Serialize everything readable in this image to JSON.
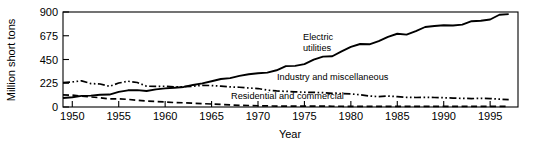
{
  "chart_data": {
    "type": "line",
    "title": "",
    "xlabel": "Year",
    "ylabel": "Million short tons",
    "xlim": [
      1949,
      1998
    ],
    "ylim": [
      0,
      900
    ],
    "yticks": [
      0,
      225,
      450,
      675,
      900
    ],
    "xticks": [
      1950,
      1955,
      1960,
      1965,
      1970,
      1975,
      1980,
      1985,
      1990,
      1995
    ],
    "ytick_labels": [
      "0",
      "225",
      "450",
      "675",
      "900"
    ],
    "xtick_labels": [
      "1950",
      "1955",
      "1960",
      "1965",
      "1970",
      "1975",
      "1980",
      "1985",
      "1990",
      "1995"
    ],
    "grid": false,
    "legend_position": "inline-annotations",
    "x": [
      1949,
      1950,
      1951,
      1952,
      1953,
      1954,
      1955,
      1956,
      1957,
      1958,
      1959,
      1960,
      1961,
      1962,
      1963,
      1964,
      1965,
      1966,
      1967,
      1968,
      1969,
      1970,
      1971,
      1972,
      1973,
      1974,
      1975,
      1976,
      1977,
      1978,
      1979,
      1980,
      1981,
      1982,
      1983,
      1984,
      1985,
      1986,
      1987,
      1988,
      1989,
      1990,
      1991,
      1992,
      1993,
      1994,
      1995,
      1996,
      1997
    ],
    "series": [
      {
        "name": "Electric utilities",
        "label": "Electric utilities",
        "label_line1": "Electric",
        "label_line2": "utilities",
        "style": "solid",
        "color": "#000000",
        "values": [
          85,
          92,
          105,
          108,
          116,
          118,
          143,
          158,
          160,
          152,
          167,
          176,
          182,
          190,
          209,
          224,
          244,
          265,
          274,
          295,
          310,
          320,
          326,
          348,
          387,
          390,
          406,
          449,
          477,
          481,
          527,
          569,
          597,
          594,
          625,
          665,
          694,
          686,
          718,
          758,
          767,
          774,
          772,
          780,
          813,
          817,
          829,
          874,
          880
        ]
      },
      {
        "name": "Industry and miscellaneous",
        "label": "Industry and miscellaneous",
        "style": "dash-dot-dot",
        "color": "#000000",
        "values": [
          232,
          237,
          248,
          222,
          218,
          196,
          227,
          244,
          232,
          197,
          195,
          197,
          190,
          192,
          197,
          205,
          203,
          198,
          190,
          187,
          180,
          175,
          160,
          152,
          148,
          144,
          140,
          138,
          136,
          130,
          127,
          124,
          116,
          104,
          98,
          104,
          98,
          92,
          90,
          92,
          90,
          88,
          84,
          82,
          80,
          82,
          80,
          74,
          70
        ]
      },
      {
        "name": "Residential and commercial",
        "label": "Residential and commercial",
        "style": "dashed",
        "color": "#000000",
        "values": [
          115,
          112,
          104,
          95,
          88,
          76,
          78,
          72,
          64,
          56,
          52,
          48,
          42,
          40,
          36,
          32,
          28,
          24,
          20,
          16,
          14,
          12,
          10,
          9,
          9,
          9,
          8,
          8,
          8,
          7,
          7,
          6,
          6,
          6,
          6,
          6,
          6,
          6,
          6,
          6,
          6,
          6,
          6,
          5,
          5,
          5,
          5,
          5,
          5
        ]
      }
    ],
    "annotations": [
      {
        "text": "Electric utilities",
        "x": 1975,
        "y": 560
      },
      {
        "text": "Industry and miscellaneous",
        "x": 1974,
        "y": 200
      },
      {
        "text": "Residential and commercial",
        "x": 1969,
        "y": 80
      }
    ]
  }
}
